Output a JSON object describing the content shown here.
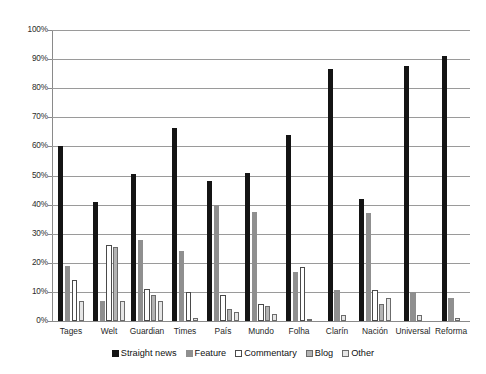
{
  "chart_data": {
    "type": "bar",
    "title": "",
    "subtitle": "",
    "xlabel": "",
    "ylabel": "",
    "ylim": [
      0,
      100
    ],
    "ytick_labels": [
      "100%",
      "90%",
      "80%",
      "70%",
      "60%",
      "50%",
      "40%",
      "30%",
      "20%",
      "10%",
      "0%"
    ],
    "ytick_values": [
      100,
      90,
      80,
      70,
      60,
      50,
      40,
      30,
      20,
      10,
      0
    ],
    "grid": true,
    "legend_position": "bottom",
    "categories": [
      "Tages",
      "Welt",
      "Guardian",
      "Times",
      "País",
      "Mundo",
      "Folha",
      "Clarín",
      "Nación",
      "Universal",
      "Reforma"
    ],
    "series": [
      {
        "name": "Straight news",
        "color": "#141414",
        "values": [
          60,
          41,
          50.5,
          66.5,
          48,
          51,
          64,
          86.5,
          42,
          87.5,
          91
        ]
      },
      {
        "name": "Feature",
        "color": "#8f8f8f",
        "values": [
          19,
          7,
          28,
          24,
          40,
          37.5,
          17,
          10.5,
          37,
          10,
          8
        ]
      },
      {
        "name": "Commentary",
        "color": "#ffffff",
        "values": [
          14,
          26,
          11,
          10,
          9,
          6,
          18.5,
          0,
          10.5,
          0,
          0
        ]
      },
      {
        "name": "Blog",
        "color": "#b3b3b3",
        "values": [
          0,
          25.5,
          9,
          0,
          4,
          5,
          0,
          0,
          6,
          0,
          0
        ]
      },
      {
        "name": "Other",
        "color": "#e6e6e6",
        "values": [
          7,
          7,
          7,
          1,
          3,
          2.5,
          0.5,
          2,
          8,
          2,
          1
        ]
      }
    ]
  }
}
